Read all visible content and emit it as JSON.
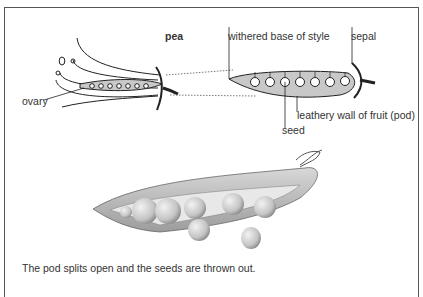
{
  "diagram": {
    "title": "pea",
    "labels": {
      "ovary": "ovary",
      "withered_base": "withered base of style",
      "sepal": "sepal",
      "leathery_wall": "leathery wall of fruit (pod)",
      "seed": "seed"
    },
    "caption": "The pod splits open and the seeds are thrown out.",
    "ovule_count_flower": 7,
    "seed_count_pod": 7,
    "colors": {
      "pod_fill": "#c8c8c8",
      "line": "#222222",
      "border": "#555555",
      "pea_light": "#e6e6e6",
      "pea_shadow": "#9a9a9a"
    }
  }
}
